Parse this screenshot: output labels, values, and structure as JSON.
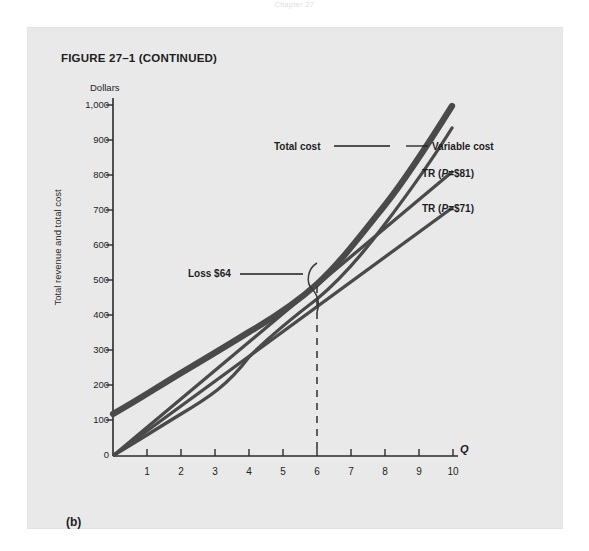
{
  "page": {
    "header_text": "Chapter 27",
    "figure_title": "FIGURE 27–1 (CONTINUED)",
    "panel_letter": "(b)"
  },
  "chart_data": {
    "type": "line",
    "title": "FIGURE 27–1 (CONTINUED)",
    "xlabel": "Q",
    "ylabel": "Total revenue and total cost",
    "y_axis_unit_label": "Dollars",
    "xlim": [
      0,
      10.6
    ],
    "ylim": [
      0,
      1060
    ],
    "grid": false,
    "legend_position": "inline-callouts",
    "yticks": [
      "0",
      "100",
      "200",
      "300",
      "400",
      "500",
      "600",
      "700",
      "800",
      "900",
      "1,000"
    ],
    "ytick_values": [
      0,
      100,
      200,
      300,
      400,
      500,
      600,
      700,
      800,
      900,
      1000
    ],
    "xticks": [
      "1",
      "2",
      "3",
      "4",
      "5",
      "6",
      "7",
      "8",
      "9",
      "10"
    ],
    "xtick_values": [
      1,
      2,
      3,
      4,
      5,
      6,
      7,
      8,
      9,
      10
    ],
    "x": [
      0,
      1,
      2,
      3,
      4,
      5,
      6,
      7,
      8,
      9,
      10
    ],
    "series": [
      {
        "name": "Total cost",
        "label": "Total cost",
        "color": "#4a4a4a",
        "width": 6,
        "values": [
          120,
          205,
          280,
          348,
          412,
          478,
          550,
          640,
          760,
          900,
          1055
        ]
      },
      {
        "name": "Variable cost",
        "label": "Variable cost",
        "color": "#4a4a4a",
        "width": 3.2,
        "values": [
          0,
          85,
          160,
          228,
          292,
          358,
          430,
          520,
          640,
          780,
          935
        ]
      },
      {
        "name": "TR (P=$81)",
        "label": "TR (P=$81)",
        "color": "#4a4a4a",
        "width": 3.2,
        "price": 81,
        "values": [
          0,
          81,
          162,
          243,
          324,
          405,
          486,
          567,
          648,
          729,
          810
        ]
      },
      {
        "name": "TR (P=$71)",
        "label": "TR (P=$71)",
        "color": "#4a4a4a",
        "width": 3.2,
        "price": 71,
        "values": [
          0,
          71,
          142,
          213,
          284,
          355,
          426,
          497,
          568,
          639,
          710
        ]
      }
    ],
    "annotations": [
      {
        "name": "loss-callout",
        "text": "Loss $64",
        "value": 64,
        "at_x": 6,
        "from_y": 486,
        "to_y": 550
      },
      {
        "name": "quantity-marker",
        "text": "",
        "at_x": 6,
        "style": "dashed-vertical"
      }
    ]
  }
}
